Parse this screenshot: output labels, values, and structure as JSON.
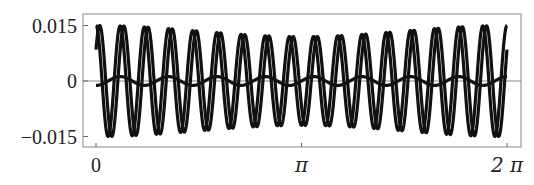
{
  "chart_data": {
    "type": "line",
    "title": "",
    "xlabel": "",
    "ylabel": "",
    "xlim": [
      0,
      6.283185
    ],
    "ylim": [
      -0.0175,
      0.018
    ],
    "grid": false,
    "legend": null,
    "x_ticks": [
      {
        "value": 0,
        "label": "0"
      },
      {
        "value": 3.141593,
        "label": "π"
      },
      {
        "value": 6.283185,
        "label": "2 π"
      }
    ],
    "y_ticks": [
      {
        "value": 0.015,
        "label": "0.015"
      },
      {
        "value": 0,
        "label": "0"
      },
      {
        "value": -0.015,
        "label": "−0.015"
      }
    ],
    "series": [
      {
        "name": "curve-1",
        "description": "large oscillation",
        "cycles": 17,
        "amplitude_edge": 0.015,
        "amplitude_center": 0.012,
        "phase": 1.5708,
        "color": "#111111"
      },
      {
        "name": "curve-2",
        "description": "large oscillation, phase-shifted",
        "cycles": 17,
        "amplitude_edge": 0.015,
        "amplitude_center": 0.012,
        "phase": 0.6,
        "color": "#111111"
      },
      {
        "name": "curve-3",
        "description": "small oscillation near zero",
        "cycles": 8.5,
        "amplitude_edge": 0.0012,
        "amplitude_center": 0.0012,
        "phase": -1.5708,
        "color": "#111111"
      }
    ],
    "frame": {
      "color": "#888888"
    },
    "zero_line": {
      "color": "#888888"
    }
  }
}
